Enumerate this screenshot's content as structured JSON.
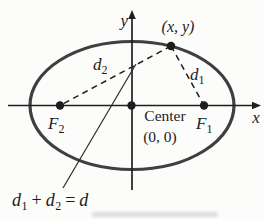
{
  "figure": {
    "type": "ellipse-with-foci-diagram",
    "axis_labels": {
      "x": "x",
      "y": "y"
    },
    "point_label": "(x, y)",
    "center_label": {
      "line1": "Center",
      "line2": "(0, 0)"
    },
    "foci": {
      "f1": {
        "base": "F",
        "sub": "1"
      },
      "f2": {
        "base": "F",
        "sub": "2"
      }
    },
    "distances": {
      "d1": {
        "base": "d",
        "sub": "1"
      },
      "d2": {
        "base": "d",
        "sub": "2"
      }
    },
    "equation": {
      "d1_base": "d",
      "d1_sub": "1",
      "plus": "+",
      "d2_base": "d",
      "d2_sub": "2",
      "equals": "=",
      "d_base": "d"
    }
  },
  "colors": {
    "ellipse_stroke": "#3f3f3f",
    "ink": "#1d1d1d",
    "background": "#fcfcfb"
  }
}
